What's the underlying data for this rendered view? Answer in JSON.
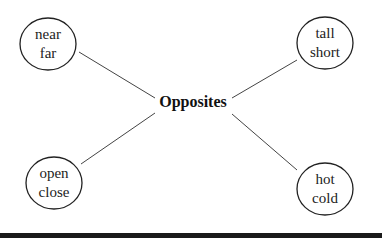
{
  "diagram": {
    "title": "Opposites",
    "center": {
      "label": "Opposites",
      "x": 193,
      "y": 104
    },
    "nodes": [
      {
        "id": "near-far",
        "line1": "near",
        "line2": "far",
        "cx": 48,
        "cy": 44
      },
      {
        "id": "tall-short",
        "line1": "tall",
        "line2": "short",
        "cx": 325,
        "cy": 43
      },
      {
        "id": "open-close",
        "line1": "open",
        "line2": "close",
        "cx": 54,
        "cy": 183
      },
      {
        "id": "hot-cold",
        "line1": "hot",
        "line2": "cold",
        "cx": 325,
        "cy": 189
      }
    ],
    "edges": [
      {
        "from": "near-far",
        "to": "Opposites"
      },
      {
        "from": "tall-short",
        "to": "Opposites"
      },
      {
        "from": "open-close",
        "to": "Opposites"
      },
      {
        "from": "hot-cold",
        "to": "Opposites"
      }
    ],
    "colors": {
      "stroke": "#222222",
      "edge": "#444444",
      "background": "#ffffff",
      "bottom_bar": "#1a1a1a"
    }
  }
}
